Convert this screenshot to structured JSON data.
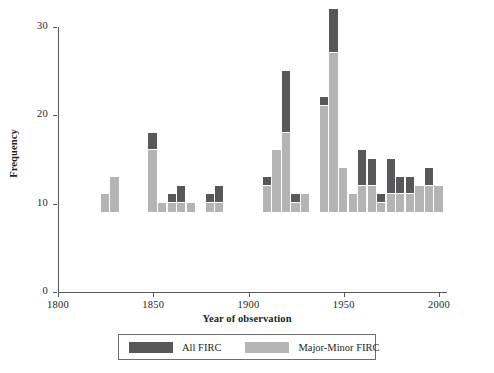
{
  "chart_data": {
    "type": "bar",
    "title": "",
    "subtitle": "",
    "xlabel": "Year of observation",
    "ylabel": "Frequency",
    "xlim": [
      1800,
      2010
    ],
    "ylim": [
      0,
      30
    ],
    "xticks": [
      1800,
      1850,
      1900,
      1950,
      2000
    ],
    "yticks": [
      0,
      10,
      20,
      30
    ],
    "grid": false,
    "stacked": true,
    "legend_position": "bottom",
    "bar_width_years": 5,
    "series": [
      {
        "name": "All FIRC",
        "color": "#58585a"
      },
      {
        "name": "Major-Minor FIRC",
        "color": "#b4b4b4"
      }
    ],
    "note": "Each bar is stacked: the light 'Major-Minor FIRC' portion sits at the bottom, the dark 'All FIRC' portion on top; bar total = light + dark.",
    "bars": [
      {
        "x": 1825,
        "major_minor": 2,
        "all": 0
      },
      {
        "x": 1830,
        "major_minor": 4,
        "all": 0
      },
      {
        "x": 1850,
        "major_minor": 7,
        "all": 2
      },
      {
        "x": 1855,
        "major_minor": 1,
        "all": 0
      },
      {
        "x": 1860,
        "major_minor": 1,
        "all": 1
      },
      {
        "x": 1865,
        "major_minor": 1,
        "all": 2
      },
      {
        "x": 1870,
        "major_minor": 1,
        "all": 0
      },
      {
        "x": 1880,
        "major_minor": 1,
        "all": 1
      },
      {
        "x": 1885,
        "major_minor": 1,
        "all": 2
      },
      {
        "x": 1910,
        "major_minor": 3,
        "all": 1
      },
      {
        "x": 1915,
        "major_minor": 7,
        "all": 0
      },
      {
        "x": 1920,
        "major_minor": 9,
        "all": 7
      },
      {
        "x": 1925,
        "major_minor": 1,
        "all": 1
      },
      {
        "x": 1930,
        "major_minor": 2,
        "all": 0
      },
      {
        "x": 1940,
        "major_minor": 12,
        "all": 1
      },
      {
        "x": 1945,
        "major_minor": 18,
        "all": 5
      },
      {
        "x": 1950,
        "major_minor": 5,
        "all": 0
      },
      {
        "x": 1955,
        "major_minor": 2,
        "all": 0
      },
      {
        "x": 1960,
        "major_minor": 3,
        "all": 4
      },
      {
        "x": 1965,
        "major_minor": 3,
        "all": 3
      },
      {
        "x": 1970,
        "major_minor": 1,
        "all": 1
      },
      {
        "x": 1975,
        "major_minor": 2,
        "all": 4
      },
      {
        "x": 1980,
        "major_minor": 2,
        "all": 2
      },
      {
        "x": 1985,
        "major_minor": 2,
        "all": 2
      },
      {
        "x": 1990,
        "major_minor": 3,
        "all": 0
      },
      {
        "x": 1995,
        "major_minor": 3,
        "all": 2
      },
      {
        "x": 2000,
        "major_minor": 3,
        "all": 0
      }
    ]
  },
  "legend": {
    "items": [
      {
        "label": "All FIRC",
        "color": "#58585a",
        "swatch": "swatch-dark"
      },
      {
        "label": "Major-Minor FIRC",
        "color": "#b4b4b4",
        "swatch": "swatch-light"
      }
    ]
  }
}
